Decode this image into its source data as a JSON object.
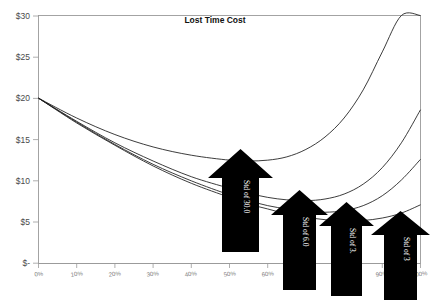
{
  "chart_data": {
    "type": "line",
    "title": "Lost Time Cost",
    "xlabel": "",
    "ylabel": "",
    "grid": false,
    "legend": "none",
    "xlim": [
      0,
      100
    ],
    "ylim": [
      0,
      30
    ],
    "x_tick_labels": [
      "0%",
      "10%",
      "20%",
      "30%",
      "40%",
      "50%",
      "60%",
      "70%",
      "80%",
      "90%",
      "100%"
    ],
    "x_tick_values": [
      0,
      10,
      20,
      30,
      40,
      50,
      60,
      70,
      80,
      90,
      100
    ],
    "y_tick_labels": [
      "$-",
      "$5",
      "$10",
      "$15",
      "$20",
      "$25",
      "$30"
    ],
    "y_tick_values": [
      0,
      5,
      10,
      15,
      20,
      25,
      30
    ],
    "x": [
      0,
      10,
      20,
      30,
      40,
      50,
      55,
      60,
      65,
      70,
      75,
      80,
      85,
      90,
      95,
      100
    ],
    "series": [
      {
        "name": "Std of 30.0",
        "values": [
          20.0,
          17.6,
          15.6,
          14.1,
          13.1,
          12.5,
          12.4,
          12.5,
          12.9,
          13.8,
          15.3,
          17.6,
          21.0,
          25.6,
          30.0,
          30.0
        ]
      },
      {
        "name": "Std of 6.0",
        "values": [
          20.0,
          17.2,
          14.6,
          12.4,
          10.5,
          9.1,
          8.5,
          8.0,
          7.7,
          7.6,
          7.8,
          8.4,
          9.6,
          11.6,
          14.6,
          18.6
        ]
      },
      {
        "name": "Std of 3.",
        "values": [
          20.0,
          17.1,
          14.4,
          12.0,
          10.0,
          8.3,
          7.6,
          7.0,
          6.6,
          6.3,
          6.2,
          6.4,
          7.0,
          8.2,
          10.1,
          12.6
        ]
      },
      {
        "name": "Std of 3",
        "values": [
          20.0,
          17.0,
          14.3,
          11.8,
          9.7,
          8.0,
          7.2,
          6.6,
          6.0,
          5.6,
          5.3,
          5.1,
          5.2,
          5.5,
          6.1,
          7.1
        ]
      }
    ],
    "annotations": [
      {
        "label": "Std of 30.0",
        "points_to_series": "Std of 30.0"
      },
      {
        "label": "Std of 6.0",
        "points_to_series": "Std of 6.0"
      },
      {
        "label": "Std of 3.",
        "points_to_series": "Std of 3."
      },
      {
        "label": "Std of 3",
        "points_to_series": "Std of 3"
      }
    ],
    "colors": {
      "curve": "#1a1a1a",
      "arrow": "#000000",
      "arrow_text": "#ffffff",
      "axis": "#9a9a9a",
      "tick_label": "#7a7a7a",
      "y_tick_label": "#4a4a4a",
      "background": "#ffffff"
    }
  }
}
